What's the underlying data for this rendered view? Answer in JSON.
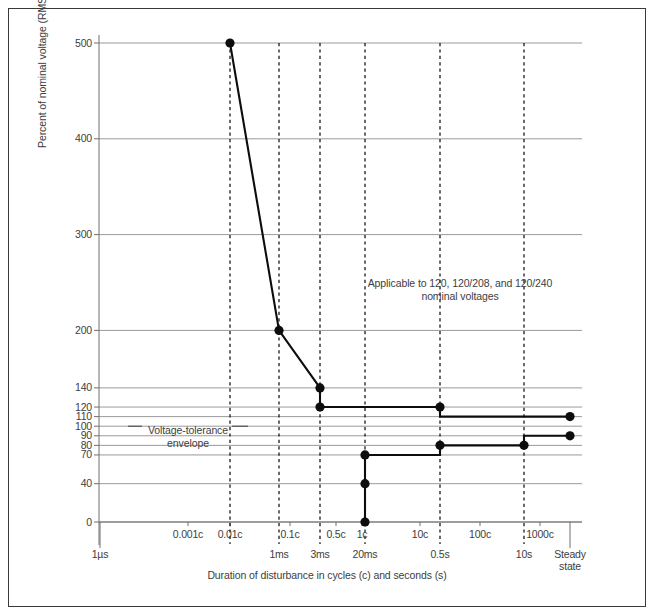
{
  "figure": {
    "background_color": "#ffffff",
    "frame_color": "#3a3a3a",
    "curve_color": "#0d0d0d",
    "grid_color": "#9a9a9a",
    "axis_color": "#6e6e6e",
    "text_color": "#3d3d3d"
  },
  "annotation": "Applicable to 120, 120/208, and 120/240 nominal voltages",
  "envelope_label": "Voltage-tolerance envelope",
  "chart_data": {
    "type": "line",
    "title": "",
    "subtitle": "",
    "xlabel": "Duration of disturbance in cycles (c) and seconds (s)",
    "ylabel": "Percent of nominal voltage (RMS or peak equivalent)",
    "grid": true,
    "legend_position": "none",
    "ylim": [
      0,
      500
    ],
    "y_ticks": [
      0,
      40,
      70,
      80,
      90,
      100,
      110,
      120,
      140,
      200,
      300,
      400,
      500
    ],
    "y_tick_labels": [
      "0",
      "40",
      "70",
      "80",
      "90",
      "100",
      "110",
      "120",
      "140",
      "200",
      "300",
      "400",
      "500"
    ],
    "x_scale": "log-like-categorical",
    "x_ticks_cycles": [
      {
        "label": "0.001c",
        "px": 188
      },
      {
        "label": "0.01c",
        "px": 230
      },
      {
        "label": "0.1c",
        "px": 290
      },
      {
        "label": "0.5c",
        "px": 336
      },
      {
        "label": "1c",
        "px": 362
      },
      {
        "label": "10c",
        "px": 420
      },
      {
        "label": "100c",
        "px": 480
      },
      {
        "label": "1000c",
        "px": 540
      }
    ],
    "x_ticks_seconds": [
      {
        "label": "1µs",
        "px": 100
      },
      {
        "label": "1ms",
        "px": 279
      },
      {
        "label": "3ms",
        "px": 320
      },
      {
        "label": "20ms",
        "px": 365
      },
      {
        "label": "0.5s",
        "px": 440
      },
      {
        "label": "10s",
        "px": 524
      },
      {
        "label": "Steady\nstate",
        "px": 570
      }
    ],
    "dashed_verticals_px": [
      230,
      279,
      320,
      365,
      440,
      524
    ],
    "annotations": [
      {
        "text": "Applicable to 120, 120/208, and 120/240 nominal voltages",
        "x_px": 460,
        "y_px": 290
      },
      {
        "text": "Voltage-tolerance envelope",
        "x_px": 188,
        "y_px": 430
      }
    ],
    "series": [
      {
        "name": "Upper voltage-tolerance envelope",
        "points": [
          {
            "x_label": "0.01c",
            "x_px": 230,
            "y": 500
          },
          {
            "x_label": "1ms",
            "x_px": 279,
            "y": 200
          },
          {
            "x_label": "3ms",
            "x_px": 320,
            "y": 140
          },
          {
            "x_label": "3ms",
            "x_px": 320,
            "y": 120
          },
          {
            "x_label": "0.5s",
            "x_px": 440,
            "y": 120
          },
          {
            "x_label": "0.5s",
            "x_px": 440,
            "y": 110
          },
          {
            "x_label": "Steady state",
            "x_px": 570,
            "y": 110
          }
        ],
        "markers_at": [
          {
            "x_px": 230,
            "y": 500
          },
          {
            "x_px": 279,
            "y": 200
          },
          {
            "x_px": 320,
            "y": 140
          },
          {
            "x_px": 320,
            "y": 120
          },
          {
            "x_px": 440,
            "y": 120
          },
          {
            "x_px": 570,
            "y": 110
          }
        ]
      },
      {
        "name": "Lower voltage-tolerance envelope",
        "points": [
          {
            "x_label": "20ms",
            "x_px": 365,
            "y": 0
          },
          {
            "x_label": "20ms",
            "x_px": 365,
            "y": 40
          },
          {
            "x_label": "20ms",
            "x_px": 365,
            "y": 70
          },
          {
            "x_label": "0.5s",
            "x_px": 440,
            "y": 70
          },
          {
            "x_label": "0.5s",
            "x_px": 440,
            "y": 80
          },
          {
            "x_label": "10s",
            "x_px": 524,
            "y": 80
          },
          {
            "x_label": "10s",
            "x_px": 524,
            "y": 90
          },
          {
            "x_label": "Steady state",
            "x_px": 570,
            "y": 90
          }
        ],
        "markers_at": [
          {
            "x_px": 365,
            "y": 0
          },
          {
            "x_px": 365,
            "y": 40
          },
          {
            "x_px": 365,
            "y": 70
          },
          {
            "x_px": 440,
            "y": 80
          },
          {
            "x_px": 524,
            "y": 80
          },
          {
            "x_px": 570,
            "y": 90
          }
        ]
      }
    ]
  }
}
